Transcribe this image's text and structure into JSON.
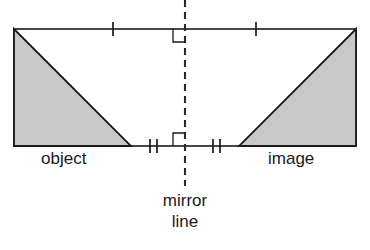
{
  "diagram": {
    "labels": {
      "object": "object",
      "image": "image",
      "mirror_line_word1": "mirror",
      "mirror_line_word2": "line"
    },
    "colors": {
      "stroke": "#1a1a1a",
      "fill_shaded": "#c9c9c9",
      "background": "#ffffff",
      "dash": "#2a2a2a"
    },
    "geometry": {
      "rect_left": 14,
      "rect_right": 356,
      "rect_top": 29,
      "rect_bottom": 146,
      "mirror_x": 185,
      "mirror_y_top": 0,
      "mirror_y_bottom": 186,
      "object_triangle": "14,29 14,146 131,146",
      "image_triangle": "356,29 356,146 239,146",
      "right_angle_top": "173,29 173,42 185,42",
      "right_angle_bottom": "173,146 173,133 185,133"
    },
    "tick_marks": {
      "top_left": {
        "x": 113,
        "y": 29,
        "count": 1
      },
      "top_right": {
        "x": 256,
        "y": 29,
        "count": 1
      },
      "bottom_left": {
        "x": 153,
        "y": 146,
        "count": 2
      },
      "bottom_right": {
        "x": 217,
        "y": 146,
        "count": 2
      }
    }
  }
}
